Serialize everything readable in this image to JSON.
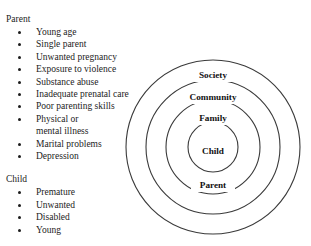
{
  "figure": {
    "background_color": "#ffffff",
    "text_color": "#1c1c1c",
    "stroke_color": "#3a3a3a"
  },
  "lists": [
    {
      "heading": "Parent",
      "items": [
        "Young age",
        "Single parent",
        "Unwanted pregnancy",
        "Exposure to violence",
        "Substance abuse",
        "Inadequate prenatal care",
        "Poor parenting skills",
        "Physical or\nmental illness",
        "Marital problems",
        "Depression"
      ]
    },
    {
      "heading": "Child",
      "items": [
        "Premature",
        "Unwanted",
        "Disabled",
        "Young"
      ]
    }
  ],
  "diagram": {
    "type": "concentric-circles",
    "center": {
      "x": 213,
      "y": 147
    },
    "rings": [
      {
        "label": "Society",
        "radius": 87,
        "label_x": 213,
        "label_y": 76
      },
      {
        "label": "Community",
        "radius": 67,
        "label_x": 213,
        "label_y": 98
      },
      {
        "label": "Family",
        "radius": 47,
        "label_x": 213,
        "label_y": 119
      },
      {
        "label": "Child",
        "radius": 25,
        "label_x": 213,
        "label_y": 152
      }
    ],
    "bottom_label": {
      "label": "Parent",
      "label_x": 213,
      "label_y": 186
    }
  }
}
